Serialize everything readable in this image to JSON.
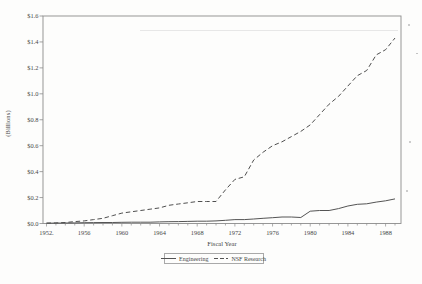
{
  "colors": {
    "line": "#545454",
    "axis": "#8c8c8c",
    "text": "#474747",
    "background": "#fdfdfc"
  },
  "chart_data": {
    "type": "line",
    "title": "",
    "xlabel": "Fiscal Year",
    "ylabel": "(Billions)",
    "grid": false,
    "frame": "box",
    "legend_position": "bottom-center",
    "ylim": [
      0,
      1.6
    ],
    "y_tick_step": 0.2,
    "y_tick_labels": [
      "$0.0",
      "$0.2",
      "$0.4",
      "$0.6",
      "$0.8",
      "$1.0",
      "$1.2",
      "$1.4",
      "$1.6"
    ],
    "x": [
      1952,
      1953,
      1954,
      1955,
      1956,
      1957,
      1958,
      1959,
      1960,
      1961,
      1962,
      1963,
      1964,
      1965,
      1966,
      1967,
      1968,
      1969,
      1970,
      1971,
      1972,
      1973,
      1974,
      1975,
      1976,
      1977,
      1978,
      1979,
      1980,
      1981,
      1982,
      1983,
      1984,
      1985,
      1986,
      1987,
      1988,
      1989
    ],
    "x_tick_years": [
      1952,
      1956,
      1960,
      1964,
      1968,
      1972,
      1976,
      1980,
      1984,
      1988
    ],
    "x_tick_labels": [
      "1952.",
      "1956",
      "1960",
      "1964",
      "1968",
      "1972",
      "1976",
      "1980",
      "1984",
      "1988"
    ],
    "series": [
      {
        "name": "Engineering",
        "line_style": "solid",
        "color": "#545454",
        "values": [
          0.002,
          0.003,
          0.004,
          0.005,
          0.006,
          0.007,
          0.008,
          0.008,
          0.009,
          0.01,
          0.01,
          0.01,
          0.012,
          0.014,
          0.015,
          0.016,
          0.018,
          0.018,
          0.02,
          0.025,
          0.03,
          0.03,
          0.035,
          0.04,
          0.045,
          0.05,
          0.05,
          0.046,
          0.095,
          0.1,
          0.1,
          0.115,
          0.135,
          0.148,
          0.152,
          0.165,
          0.175,
          0.19
        ]
      },
      {
        "name": "NSF Research",
        "line_style": "dashed",
        "color": "#4f4f4f",
        "values": [
          0.003,
          0.005,
          0.008,
          0.015,
          0.02,
          0.03,
          0.04,
          0.06,
          0.08,
          0.09,
          0.1,
          0.11,
          0.12,
          0.14,
          0.15,
          0.16,
          0.17,
          0.17,
          0.17,
          0.26,
          0.34,
          0.36,
          0.49,
          0.55,
          0.6,
          0.63,
          0.67,
          0.71,
          0.76,
          0.84,
          0.92,
          0.98,
          1.06,
          1.14,
          1.18,
          1.3,
          1.34,
          1.43
        ]
      }
    ]
  }
}
